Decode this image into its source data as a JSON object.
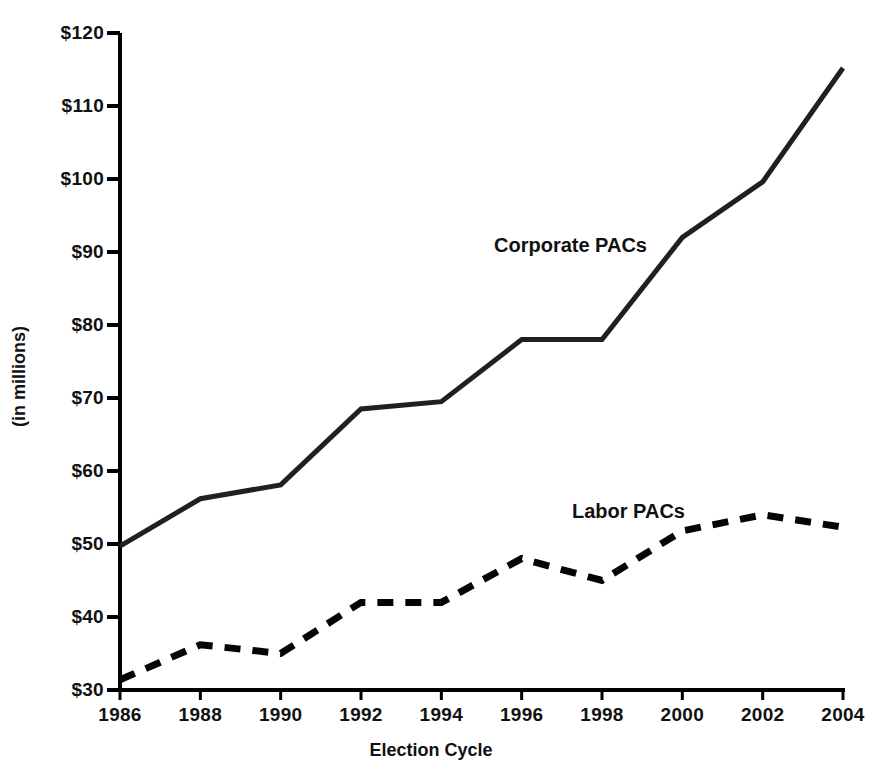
{
  "chart_data": {
    "type": "line",
    "title": "",
    "subtitle": "",
    "xlabel": "Election Cycle",
    "ylabel": "(in millions)",
    "x": [
      1986,
      1988,
      1990,
      1992,
      1994,
      1996,
      1998,
      2000,
      2002,
      2004
    ],
    "categories": [
      "1986",
      "1988",
      "1990",
      "1992",
      "1994",
      "1996",
      "1998",
      "2000",
      "2002",
      "2004"
    ],
    "xlim": [
      1986,
      2004
    ],
    "ylim": [
      30,
      120
    ],
    "y_ticks": [
      30,
      40,
      50,
      60,
      70,
      80,
      90,
      100,
      110,
      120
    ],
    "y_tick_labels": [
      "$30",
      "$40",
      "$50",
      "$60",
      "$70",
      "$80",
      "$90",
      "$100",
      "$110",
      "$120"
    ],
    "x_ticks": [
      1986,
      1988,
      1990,
      1992,
      1994,
      1996,
      1998,
      2000,
      2002,
      2004
    ],
    "x_tick_labels": [
      "1986",
      "1988",
      "1990",
      "1992",
      "1994",
      "1996",
      "1998",
      "2000",
      "2002",
      "2004"
    ],
    "grid": false,
    "legend_position": "inline-annotation",
    "series": [
      {
        "name": "Corporate PACs",
        "style": "solid",
        "color": "#221f1f",
        "width": 5,
        "values": [
          49.7,
          56.2,
          58.1,
          68.5,
          69.5,
          78.0,
          78.0,
          92.0,
          99.6,
          115.2
        ],
        "label_x": 1994.1,
        "label_y": 92.5
      },
      {
        "name": "Labor PACs",
        "style": "dashed",
        "color": "#050505",
        "width": 7,
        "values": [
          31.4,
          36.2,
          35.0,
          42.0,
          42.0,
          48.0,
          45.0,
          51.8,
          54.0,
          52.3
        ],
        "label_x": 1996.3,
        "label_y": 56.0
      }
    ],
    "annotations": [
      {
        "text": "Corporate PACs",
        "x": 1994.1,
        "y": 92.5
      },
      {
        "text": "Labor PACs",
        "x": 1996.3,
        "y": 56.0
      }
    ]
  },
  "axis": {
    "x_title": "Election Cycle",
    "y_title": "(in millions)"
  }
}
